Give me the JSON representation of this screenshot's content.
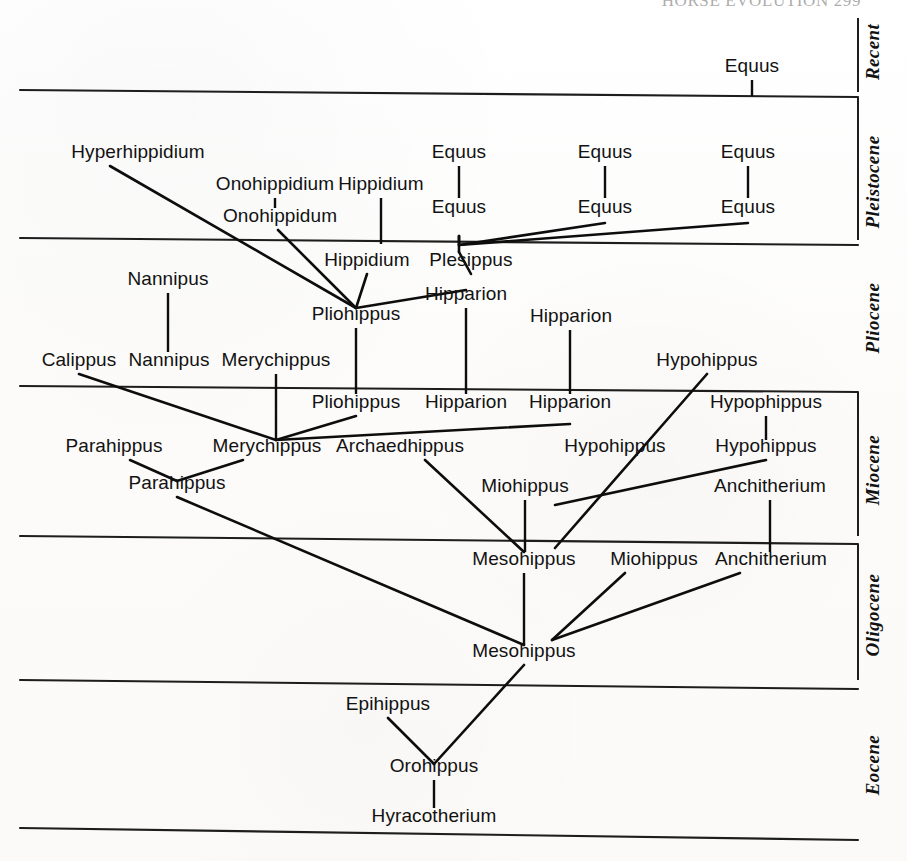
{
  "page": {
    "running_header": "HORSE  EVOLUTION    299",
    "width": 907,
    "height": 861,
    "background_color": "#fdfdfc",
    "ink_color": "#0d0d0d"
  },
  "epochs": [
    {
      "id": "recent",
      "label": "Recent",
      "label_x": 879,
      "label_y": 52,
      "band_top": 18,
      "band_bottom": 92
    },
    {
      "id": "pleistocene",
      "label": "Pleistocene",
      "label_x": 879,
      "label_y": 182,
      "band_top": 92,
      "band_bottom": 240
    },
    {
      "id": "pliocene",
      "label": "Pliocene",
      "label_x": 879,
      "label_y": 318,
      "band_top": 240,
      "band_bottom": 389
    },
    {
      "id": "miocene",
      "label": "Miocene",
      "label_x": 879,
      "label_y": 470,
      "band_top": 389,
      "band_bottom": 540
    },
    {
      "id": "oligocene",
      "label": "Oligocene",
      "label_x": 879,
      "label_y": 615,
      "band_top": 540,
      "band_bottom": 684
    },
    {
      "id": "eocene",
      "label": "Eocene",
      "label_x": 879,
      "label_y": 765,
      "band_top": 684,
      "band_bottom": 834
    }
  ],
  "epoch_dividers": [
    {
      "id": "recent-pleistocene",
      "x1": 20,
      "y1": 90,
      "x2": 858,
      "y2": 97
    },
    {
      "id": "pleistocene-pliocene",
      "x1": 20,
      "y1": 238,
      "x2": 858,
      "y2": 245
    },
    {
      "id": "pliocene-miocene",
      "x1": 20,
      "y1": 386,
      "x2": 858,
      "y2": 392
    },
    {
      "id": "miocene-oligocene",
      "x1": 20,
      "y1": 536,
      "x2": 858,
      "y2": 544
    },
    {
      "id": "oligocene-eocene",
      "x1": 20,
      "y1": 680,
      "x2": 858,
      "y2": 689
    },
    {
      "id": "eocene-base",
      "x1": 20,
      "y1": 828,
      "x2": 858,
      "y2": 840
    }
  ],
  "epoch_ticks": [
    {
      "id": "tick-recent",
      "x1": 858,
      "y1": 18,
      "x2": 858,
      "y2": 92
    },
    {
      "id": "tick-pleistocene",
      "x1": 858,
      "y1": 97,
      "x2": 858,
      "y2": 240
    },
    {
      "id": "tick-miocene",
      "x1": 858,
      "y1": 392,
      "x2": 858,
      "y2": 536
    },
    {
      "id": "tick-oligocene",
      "x1": 858,
      "y1": 544,
      "x2": 858,
      "y2": 680
    }
  ],
  "taxa": [
    {
      "id": "equus-recent",
      "name": "Equus",
      "x": 752,
      "y": 72
    },
    {
      "id": "hyperhippidium",
      "name": "Hyperhippidium",
      "x": 138,
      "y": 158
    },
    {
      "id": "equus-pleist-upper-1",
      "name": "Equus",
      "x": 459,
      "y": 158
    },
    {
      "id": "equus-pleist-upper-2",
      "name": "Equus",
      "x": 605,
      "y": 158
    },
    {
      "id": "equus-pleist-upper-3",
      "name": "Equus",
      "x": 748,
      "y": 158
    },
    {
      "id": "onohippidium",
      "name": "Onohippidium",
      "x": 275,
      "y": 190
    },
    {
      "id": "hippidium-upper",
      "name": "Hippidium",
      "x": 381,
      "y": 190
    },
    {
      "id": "onohippidum",
      "name": "Onohippidum",
      "x": 280,
      "y": 222
    },
    {
      "id": "equus-pleist-lower-1",
      "name": "Equus",
      "x": 459,
      "y": 213
    },
    {
      "id": "equus-pleist-lower-2",
      "name": "Equus",
      "x": 605,
      "y": 213
    },
    {
      "id": "equus-pleist-lower-3",
      "name": "Equus",
      "x": 748,
      "y": 213
    },
    {
      "id": "hippidium-lower",
      "name": "Hippidium",
      "x": 367,
      "y": 266
    },
    {
      "id": "plesippus",
      "name": "Plesippus",
      "x": 471,
      "y": 266
    },
    {
      "id": "nannipus-upper",
      "name": "Nannipus",
      "x": 168,
      "y": 285
    },
    {
      "id": "pliohippus-upper",
      "name": "Pliohippus",
      "x": 356,
      "y": 320
    },
    {
      "id": "hipparion-plio-1",
      "name": "Hipparion",
      "x": 466,
      "y": 300
    },
    {
      "id": "hipparion-plio-2",
      "name": "Hipparion",
      "x": 571,
      "y": 322
    },
    {
      "id": "calippus",
      "name": "Calippus",
      "x": 79,
      "y": 366
    },
    {
      "id": "nannipus-lower",
      "name": "Nannipus",
      "x": 169,
      "y": 366
    },
    {
      "id": "merychippus-upper",
      "name": "Merychippus",
      "x": 276,
      "y": 366
    },
    {
      "id": "hypohippus-plio",
      "name": "Hypohippus",
      "x": 707,
      "y": 366
    },
    {
      "id": "pliohippus-lower",
      "name": "Pliohippus",
      "x": 356,
      "y": 408
    },
    {
      "id": "hipparion-mio-1",
      "name": "Hipparion",
      "x": 466,
      "y": 408
    },
    {
      "id": "hipparion-mio-2",
      "name": "Hipparion",
      "x": 570,
      "y": 408
    },
    {
      "id": "hypophippus",
      "name": "Hypophippus",
      "x": 766,
      "y": 408
    },
    {
      "id": "parahippus-upper",
      "name": "Parahippus",
      "x": 114,
      "y": 452
    },
    {
      "id": "merychippus-lower",
      "name": "Merychippus",
      "x": 267,
      "y": 452
    },
    {
      "id": "archaedhippus",
      "name": "Archaedhippus",
      "x": 400,
      "y": 452
    },
    {
      "id": "hypohippus-mio-1",
      "name": "Hypohippus",
      "x": 615,
      "y": 452
    },
    {
      "id": "hypohippus-mio-2",
      "name": "Hypohippus",
      "x": 766,
      "y": 452
    },
    {
      "id": "parahippus-lower",
      "name": "Parahippus",
      "x": 177,
      "y": 489
    },
    {
      "id": "miohippus-mio",
      "name": "Miohippus",
      "x": 525,
      "y": 492
    },
    {
      "id": "anchitherium-mio",
      "name": "Anchitherium",
      "x": 770,
      "y": 492
    },
    {
      "id": "mesohippus-upper",
      "name": "Mesohippus",
      "x": 524,
      "y": 565
    },
    {
      "id": "miohippus-oligo",
      "name": "Miohippus",
      "x": 654,
      "y": 565
    },
    {
      "id": "anchitherium-oligo",
      "name": "Anchitherium",
      "x": 771,
      "y": 565
    },
    {
      "id": "mesohippus-lower",
      "name": "Mesohippus",
      "x": 524,
      "y": 657
    },
    {
      "id": "epihippus",
      "name": "Epihippus",
      "x": 388,
      "y": 710
    },
    {
      "id": "orohippus",
      "name": "Orohippus",
      "x": 434,
      "y": 772
    },
    {
      "id": "hyracotherium",
      "name": "Hyracotherium",
      "x": 434,
      "y": 822
    }
  ],
  "lineages": [
    {
      "id": "stem-equus-recent",
      "type": "stem",
      "points": "752,80 752,96"
    },
    {
      "id": "stem-equus-pleist-1",
      "type": "stem",
      "points": "459,166 459,198"
    },
    {
      "id": "stem-equus-pleist-2",
      "type": "stem",
      "points": "605,166 605,198"
    },
    {
      "id": "stem-equus-pleist-3",
      "type": "stem",
      "points": "748,166 748,198"
    },
    {
      "id": "stem-onohippidium",
      "type": "stem",
      "points": "275,198 275,208"
    },
    {
      "id": "stem-hippidium-upper",
      "type": "stem",
      "points": "381,198 381,244"
    },
    {
      "id": "stem-nannipus",
      "type": "stem",
      "points": "168,293 168,352"
    },
    {
      "id": "stem-pliohippus",
      "type": "stem",
      "points": "356,328 356,394"
    },
    {
      "id": "stem-hipparion-plio-1",
      "type": "stem",
      "points": "466,308 466,394"
    },
    {
      "id": "stem-hipparion-plio-2",
      "type": "stem",
      "points": "570,330 570,394"
    },
    {
      "id": "stem-merychippus-upper",
      "type": "stem",
      "points": "276,374 276,440"
    },
    {
      "id": "stem-hypophippus",
      "type": "stem",
      "points": "766,416 766,440"
    },
    {
      "id": "stem-mesohippus-upper",
      "type": "stem",
      "points": "524,573 524,645"
    },
    {
      "id": "stem-miohippus-mio",
      "type": "stem",
      "points": "525,500 525,552"
    },
    {
      "id": "stem-anchitherium-mio",
      "type": "stem",
      "points": "770,500 770,552"
    },
    {
      "id": "stem-orohippus",
      "type": "stem",
      "points": "434,780 434,808"
    },
    {
      "id": "hyperhippidium-to-pliohippus",
      "type": "lineage",
      "points": "110,166 356,308"
    },
    {
      "id": "onohippidum-to-pliohippus",
      "type": "lineage",
      "points": "278,230 356,308"
    },
    {
      "id": "hippidium-to-pliohippus",
      "type": "lineage",
      "points": "367,274 356,308"
    },
    {
      "id": "plesippus-to-equus-branch",
      "type": "lineage",
      "points": "459,252 459,236"
    },
    {
      "id": "plesippus-riser",
      "type": "lineage",
      "points": "459,236 459,245"
    },
    {
      "id": "equus-fan-left",
      "type": "lineage",
      "points": "459,245 605,223"
    },
    {
      "id": "equus-fan-right",
      "type": "lineage",
      "points": "459,245 748,223"
    },
    {
      "id": "plesippus-to-pliohippus",
      "type": "lineage",
      "points": "459,252 471,274"
    },
    {
      "id": "hipparion-plio-to-pliohippus",
      "type": "lineage",
      "points": "356,308 466,290"
    },
    {
      "id": "calippus-to-merychippus",
      "type": "lineage",
      "points": "79,374 276,440"
    },
    {
      "id": "merychippus-fan-pliohippus",
      "type": "lineage",
      "points": "276,440 356,416"
    },
    {
      "id": "merychippus-fan-hipparion",
      "type": "lineage",
      "points": "276,440 570,424"
    },
    {
      "id": "parahippus-up-to-para-low",
      "type": "lineage",
      "points": "130,460 177,481"
    },
    {
      "id": "merychippus-low-to-para-low",
      "type": "lineage",
      "points": "243,460 177,481"
    },
    {
      "id": "parahippus-to-mesohippus",
      "type": "lineage",
      "points": "177,497 524,645"
    },
    {
      "id": "archaedhippus-to-mesohippus",
      "type": "lineage",
      "points": "425,460 524,552"
    },
    {
      "id": "hypohippus-to-miohippus",
      "type": "lineage",
      "points": "707,374 555,548"
    },
    {
      "id": "hypohippus-mio2-to-fan",
      "type": "lineage",
      "points": "766,460 555,505"
    },
    {
      "id": "miohippus-oligo-to-meso",
      "type": "lineage",
      "points": "625,573 552,640"
    },
    {
      "id": "anchitherium-oligo-to-meso",
      "type": "lineage",
      "points": "740,573 552,640"
    },
    {
      "id": "mesohippus-to-orohippus",
      "type": "lineage",
      "points": "524,665 434,764"
    },
    {
      "id": "epihippus-to-orohippus",
      "type": "lineage",
      "points": "388,718 434,764"
    }
  ]
}
